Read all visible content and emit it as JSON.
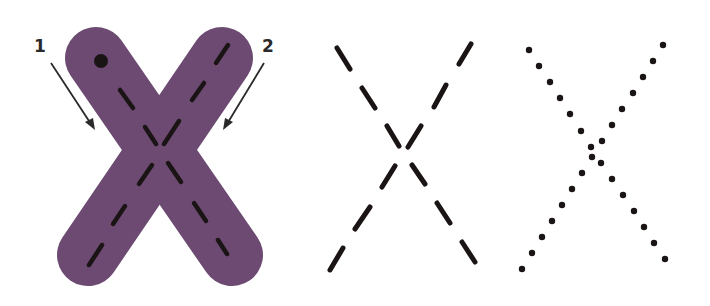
{
  "worksheet": {
    "letter": "X",
    "colors": {
      "letter_fill": "#6c4a72",
      "stroke_ink": "#1a1414",
      "arrow": "#2a2a2a",
      "background": "#ffffff"
    },
    "panels": [
      {
        "id": "solid-letter",
        "style": "filled purple letter with dashed center guides and start dot"
      },
      {
        "id": "dashed-letter",
        "style": "dashed tracing guide"
      },
      {
        "id": "dotted-letter",
        "style": "dotted tracing guide"
      }
    ],
    "stroke_order": [
      {
        "number": "1",
        "direction": "down-right"
      },
      {
        "number": "2",
        "direction": "down-left"
      }
    ]
  }
}
